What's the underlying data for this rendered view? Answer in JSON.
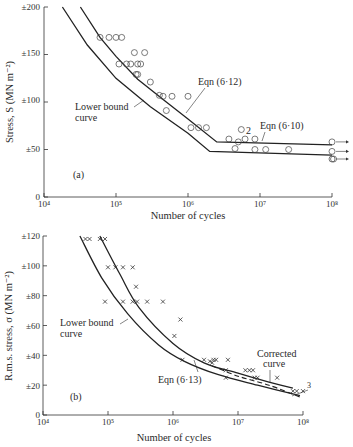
{
  "chart_data": [
    {
      "id": "a",
      "type": "scatter",
      "panel_label": "(a)",
      "title": "",
      "xlabel": "Number of cycles",
      "ylabel": "Stress, S (MN m⁻²)",
      "xscale": "log",
      "xlim": [
        10000,
        100000000
      ],
      "ylim": [
        0,
        200
      ],
      "x_tick_labels": [
        "10⁴",
        "10⁵",
        "10⁶",
        "10⁷",
        "10⁸"
      ],
      "y_tick_labels": [
        "0",
        "±50",
        "±100",
        "±150",
        "±200"
      ],
      "y_ticks": [
        0,
        50,
        100,
        150,
        200
      ],
      "grid": false,
      "markers": "open-circle",
      "points": [
        [
          60000,
          168
        ],
        [
          80000,
          168
        ],
        [
          100000,
          168
        ],
        [
          120000,
          168
        ],
        [
          180000,
          152
        ],
        [
          250000,
          152
        ],
        [
          110000,
          140
        ],
        [
          140000,
          140
        ],
        [
          160000,
          140
        ],
        [
          200000,
          140
        ],
        [
          220000,
          140
        ],
        [
          190000,
          129
        ],
        [
          200000,
          129
        ],
        [
          300000,
          121
        ],
        [
          400000,
          107
        ],
        [
          450000,
          106
        ],
        [
          600000,
          106
        ],
        [
          1000000,
          106
        ],
        [
          500000,
          91
        ],
        [
          1100000,
          73
        ],
        [
          1400000,
          73
        ],
        [
          1800000,
          73
        ],
        [
          5500000,
          71
        ],
        [
          3700000,
          61
        ],
        [
          6200000,
          61
        ],
        [
          8500000,
          61
        ],
        [
          5000000,
          58
        ],
        [
          4500000,
          51
        ],
        [
          8500000,
          50
        ],
        [
          12000000,
          50
        ],
        [
          25000000,
          50
        ],
        [
          100000000,
          58
        ],
        [
          100000000,
          48
        ],
        [
          100000000,
          40
        ],
        [
          105000000,
          40
        ]
      ],
      "runouts": [
        [
          100000000,
          58
        ],
        [
          100000000,
          48
        ],
        [
          100000000,
          40
        ]
      ],
      "point_annotation": {
        "text": "2",
        "x": 6200000,
        "y": 68
      },
      "series": [
        {
          "name": "Eqn (6·12)",
          "x": [
            32000,
            60000,
            100000,
            200000,
            500000,
            1000000,
            2500000,
            100000000
          ],
          "y": [
            200,
            168,
            148,
            124,
            100,
            82,
            58,
            55
          ]
        },
        {
          "name": "Lower bound curve",
          "x": [
            18000,
            40000,
            100000,
            300000,
            1000000,
            2000000,
            100000000
          ],
          "y": [
            200,
            160,
            125,
            95,
            67,
            48,
            44
          ]
        }
      ],
      "annotations": [
        "Eqn (6·12)",
        "Eqn (6·10)",
        "Lower bound curve",
        "(a)"
      ]
    },
    {
      "id": "b",
      "type": "scatter",
      "panel_label": "(b)",
      "title": "",
      "xlabel": "Number of cycles",
      "ylabel": "R.m.s. stress, σ (MN m⁻²)",
      "xscale": "log",
      "xlim": [
        10000,
        100000000
      ],
      "ylim": [
        0,
        120
      ],
      "x_tick_labels": [
        "10⁴",
        "10⁵",
        "10⁶",
        "10⁷",
        "10⁸"
      ],
      "y_tick_labels": [
        "0",
        "±20",
        "±40",
        "±60",
        "±80",
        "±100",
        "±120"
      ],
      "y_ticks": [
        0,
        20,
        40,
        60,
        80,
        100,
        120
      ],
      "grid": false,
      "markers": "cross",
      "points": [
        [
          45000,
          118
        ],
        [
          52000,
          118
        ],
        [
          75000,
          118
        ],
        [
          90000,
          118
        ],
        [
          100000,
          99
        ],
        [
          130000,
          99
        ],
        [
          170000,
          99
        ],
        [
          240000,
          99
        ],
        [
          270000,
          86
        ],
        [
          90000,
          76
        ],
        [
          170000,
          76
        ],
        [
          240000,
          76
        ],
        [
          280000,
          76
        ],
        [
          400000,
          76
        ],
        [
          700000,
          76
        ],
        [
          1300000,
          64
        ],
        [
          1050000,
          53
        ],
        [
          1400000,
          37
        ],
        [
          3000000,
          37
        ],
        [
          3700000,
          36
        ],
        [
          4200000,
          37
        ],
        [
          4600000,
          37
        ],
        [
          7000000,
          37
        ],
        [
          4000000,
          35
        ],
        [
          6500000,
          30
        ],
        [
          13000000,
          30
        ],
        [
          15000000,
          30
        ],
        [
          17000000,
          30
        ],
        [
          6500000,
          25
        ],
        [
          18000000,
          25
        ],
        [
          20000000,
          25
        ],
        [
          40000000,
          25
        ],
        [
          70000000,
          16
        ],
        [
          80000000,
          16
        ],
        [
          100000000,
          16
        ]
      ],
      "point_annotation": {
        "text": "3",
        "x": 110000000,
        "y": 19
      },
      "series": [
        {
          "name": "Corrected curve",
          "x": [
            75000,
            150000,
            300000,
            1000000,
            3000000,
            10000000,
            30000000,
            70000000
          ],
          "y": [
            120,
            95,
            72,
            48,
            35,
            28,
            22,
            18
          ]
        },
        {
          "name": "Lower bound curve",
          "x": [
            37000,
            80000,
            200000,
            600000,
            1500000,
            5000000,
            20000000,
            90000000
          ],
          "y": [
            120,
            92,
            68,
            47,
            36,
            27,
            20,
            13
          ]
        },
        {
          "name": "Eqn (6·13)",
          "style": "dashed",
          "x": [
            4000000,
            10000000,
            30000000,
            90000000
          ],
          "y": [
            33,
            26,
            20,
            12
          ]
        }
      ],
      "annotations": [
        "Corrected curve",
        "Eqn (6·13)",
        "Lower bound curve",
        "(b)"
      ]
    }
  ],
  "labels": {
    "a": {
      "ylabel": "Stress, S (MN m⁻²)",
      "xlabel": "Number of cycles",
      "panel": "(a)",
      "eqn612": "Eqn (6·12)",
      "eqn610": "Eqn (6·10)",
      "lower1": "Lower bound",
      "lower2": "curve",
      "note": "2",
      "xt": [
        "10⁴",
        "10⁵",
        "10⁶",
        "10⁷",
        "10⁸"
      ],
      "yt": [
        "0",
        "±50",
        "±100",
        "±150",
        "±200"
      ]
    },
    "b": {
      "ylabel": "R.m.s. stress, σ (MN m⁻²)",
      "xlabel": "Number of cycles",
      "panel": "(b)",
      "eqn613": "Eqn (6·13)",
      "corr1": "Corrected",
      "corr2": "curve",
      "lower1": "Lower bound",
      "lower2": "curve",
      "note": "3",
      "xt": [
        "10⁴",
        "10⁵",
        "10⁶",
        "10⁷",
        "10⁸"
      ],
      "yt": [
        "0",
        "±20",
        "±40",
        "±60",
        "±80",
        "±100",
        "±120"
      ]
    }
  }
}
